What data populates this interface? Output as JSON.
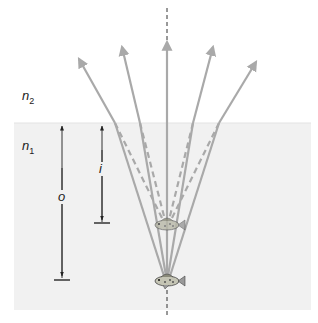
{
  "diagram": {
    "type": "refraction-apparent-depth",
    "media": {
      "upper": {
        "label_base": "n",
        "label_sub": "2"
      },
      "lower": {
        "label_base": "n",
        "label_sub": "1"
      }
    },
    "dimensions": {
      "object_distance": {
        "label": "o"
      },
      "image_distance": {
        "label": "i"
      }
    },
    "colors": {
      "ray": "#a9a9a9",
      "water": "#f1f1f1",
      "normal_line": "#333333",
      "dimension_line": "#333333"
    },
    "rays": {
      "count": 5,
      "solid_refracted": "rays bend at surface away from normal",
      "dashed_extrapolated": "back-extensions converge on virtual image"
    },
    "objects": [
      {
        "name": "fish-object",
        "role": "real object"
      },
      {
        "name": "fish-image",
        "role": "apparent (virtual) image"
      }
    ]
  }
}
